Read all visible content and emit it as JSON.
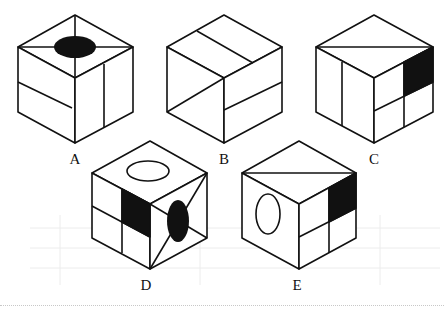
{
  "diagram": {
    "type": "cube-options",
    "stroke_color": "#111111",
    "fill_color": "#111111",
    "background_grid_color": "#e6e6e6",
    "options": [
      {
        "label": "A",
        "top_face": "black ellipse with two diagonals",
        "left_face": "one line dividing",
        "right_face": "vertical line"
      },
      {
        "label": "B",
        "top_face": "line parallel dividing",
        "left_face": "diagonal line",
        "right_face": "horizontal line"
      },
      {
        "label": "C",
        "top_face": "diagonal line",
        "left_face": "vertical line",
        "right_face": "4 quadrants, one black"
      },
      {
        "label": "D",
        "top_face": "white ellipse",
        "left_face": "4 quadrants, one black",
        "right_face": "black ellipse with diagonals"
      },
      {
        "label": "E",
        "top_face": "diagonal line",
        "left_face": "white ellipse",
        "right_face": "4 quadrants, one black"
      }
    ]
  },
  "labels": {
    "a": "A",
    "b": "B",
    "c": "C",
    "d": "D",
    "e": "E"
  }
}
